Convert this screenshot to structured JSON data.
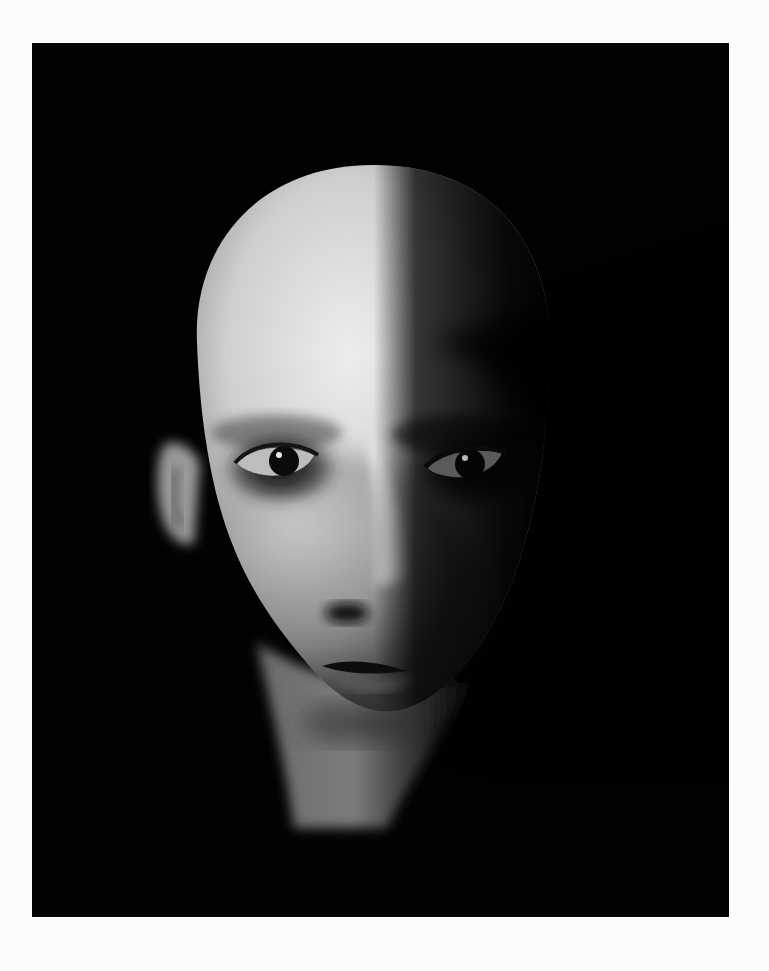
{
  "page": {
    "background_color": "#fbfbfb"
  },
  "photo": {
    "subject": "black-and-white portrait of a bald person, face lit from the left, right side in deep shadow",
    "style": "monochrome, high contrast, chiaroscuro",
    "background_color": "#020202",
    "frame": {
      "x": 32,
      "y": 43,
      "width": 697,
      "height": 874
    },
    "highlight_color": "#e6e6e6",
    "shadow_color": "#050505"
  }
}
